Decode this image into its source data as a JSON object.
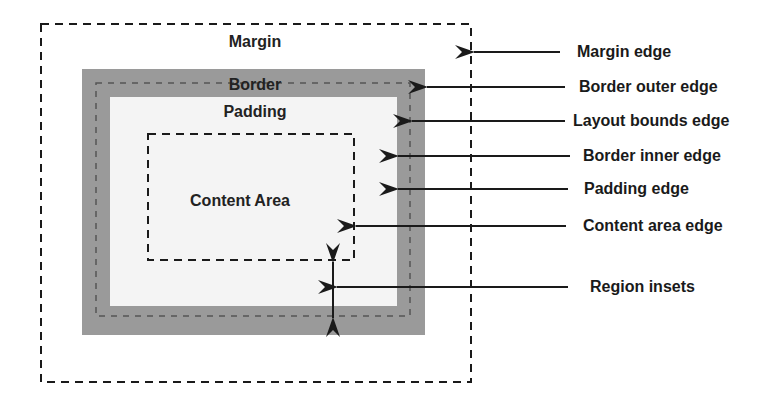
{
  "diagram": {
    "regions": {
      "margin": "Margin",
      "border": "Border",
      "padding": "Padding",
      "content": "Content Area"
    },
    "callouts": [
      {
        "id": "margin-edge",
        "label": "Margin edge"
      },
      {
        "id": "border-outer-edge",
        "label": "Border outer edge"
      },
      {
        "id": "layout-bounds-edge",
        "label": "Layout bounds edge"
      },
      {
        "id": "border-inner-edge",
        "label": "Border inner edge"
      },
      {
        "id": "padding-edge",
        "label": "Padding edge"
      },
      {
        "id": "content-area-edge",
        "label": "Content area edge"
      },
      {
        "id": "region-insets",
        "label": "Region insets"
      }
    ],
    "colors": {
      "border_fill": "#9a9a9a",
      "padding_fill": "#f4f4f4",
      "line": "#1a1a1a"
    }
  }
}
